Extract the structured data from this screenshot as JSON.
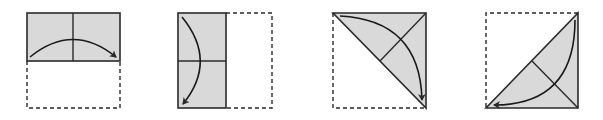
{
  "figure": {
    "colors": {
      "paper_fill": "#d9d9d9",
      "stroke": "#2a2a2a",
      "background": "#ffffff"
    },
    "steps": [
      {
        "id": 1,
        "fold": "fold bottom half up onto top half",
        "arrow": "left-to-right arc over vertical crease"
      },
      {
        "id": 2,
        "fold": "fold right half over onto left half",
        "arrow": "top-to-bottom arc across horizontal crease"
      },
      {
        "id": 3,
        "fold": "fold along diagonal, lower-left triangle folded up",
        "arrow": "top-left to bottom-right arc"
      },
      {
        "id": 4,
        "fold": "fold along anti-diagonal, upper-left triangle folded down",
        "arrow": "top-right to bottom-left arc"
      }
    ]
  }
}
